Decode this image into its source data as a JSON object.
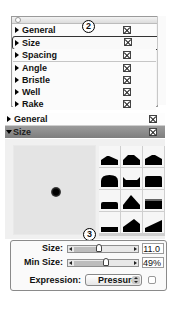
{
  "top_panel": {
    "items": [
      {
        "label": "General",
        "enabled": true
      },
      {
        "label": "Size",
        "enabled": true,
        "selected": true
      },
      {
        "label": "Spacing",
        "enabled": true
      },
      {
        "label": "Angle",
        "enabled": true
      },
      {
        "label": "Bristle",
        "enabled": true
      },
      {
        "label": "Well",
        "enabled": true
      },
      {
        "label": "Rake",
        "enabled": true
      }
    ],
    "callout": "2"
  },
  "bottom_panel": {
    "sections": [
      {
        "label": "General",
        "expanded": false
      },
      {
        "label": "Size",
        "expanded": true
      }
    ],
    "tip_shapes": [
      "peak-1",
      "peak-2",
      "peak-3",
      "round",
      "notched",
      "flat-round",
      "low-flat",
      "peak-tall",
      "flat-soft",
      "thin-flat",
      "ramp-steep",
      "ramp-shallow"
    ],
    "callout": "3"
  },
  "controls": {
    "size": {
      "label": "Size:",
      "value": "11.0",
      "slider_pct": 45
    },
    "min_size": {
      "label": "Min Size:",
      "value": "49%",
      "slider_pct": 60
    },
    "expression": {
      "label": "Expression:",
      "selected": "Pressure",
      "checkbox_checked": false
    }
  }
}
